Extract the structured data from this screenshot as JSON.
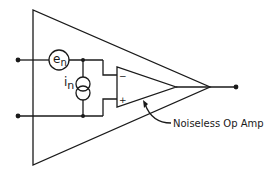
{
  "diagram": {
    "type": "op-amp noise model",
    "labels": {
      "voltage_noise": "e",
      "voltage_noise_sub": "n",
      "current_noise": "i",
      "current_noise_sub": "n",
      "inverting_input": "−",
      "noninverting_input": "+",
      "callout": "Noiseless Op Amp"
    },
    "colors": {
      "stroke": "#1a1a1a",
      "background": "#ffffff"
    }
  }
}
